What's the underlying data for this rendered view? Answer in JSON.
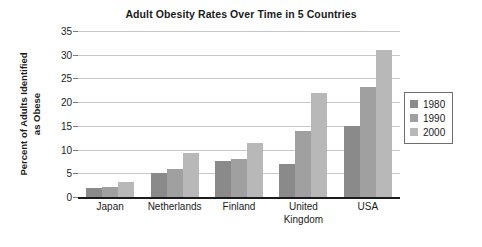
{
  "chart_data": {
    "type": "bar",
    "title": "Adult Obesity Rates Over Time in 5 Countries",
    "xlabel": "",
    "ylabel": "Percent of Adults Identified as Obese",
    "ylabel_lines": [
      "Percent of Adults Identified",
      "as Obese"
    ],
    "categories": [
      "Japan",
      "Netherlands",
      "Finland",
      "United Kingdom",
      "USA"
    ],
    "category_label_lines": [
      [
        "Japan"
      ],
      [
        "Netherlands"
      ],
      [
        "Finland"
      ],
      [
        "United",
        "Kingdom"
      ],
      [
        "USA"
      ]
    ],
    "series": [
      {
        "name": "1980",
        "color": "#8a8a8a",
        "values": [
          1.8,
          5.0,
          7.5,
          7.0,
          15.0
        ]
      },
      {
        "name": "1990",
        "color": "#a0a0a0",
        "values": [
          2.1,
          6.0,
          8.0,
          14.0,
          23.3
        ]
      },
      {
        "name": "2000",
        "color": "#b8b8b8",
        "values": [
          3.1,
          9.3,
          11.3,
          22.0,
          31.0
        ]
      }
    ],
    "ylim": [
      0,
      35
    ],
    "yticks": [
      0,
      5,
      10,
      15,
      20,
      25,
      30,
      35
    ],
    "ytick_labels": [
      "0",
      "5",
      "10",
      "15",
      "20",
      "25",
      "30",
      "35"
    ],
    "grid": true,
    "legend_position": "right",
    "legend_entries": [
      "1980",
      "1990",
      "2000"
    ]
  }
}
